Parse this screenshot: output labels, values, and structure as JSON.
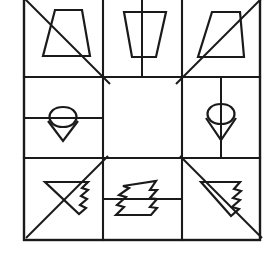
{
  "puzzle": {
    "title": "Matrix Reasoning Item",
    "type": "progressive-matrix",
    "rows": 3,
    "columns": 3,
    "stroke_color": "#1a1a1a",
    "background_color": "#ffffff",
    "grid": {
      "x_lines": [
        24,
        103,
        182,
        260
      ],
      "y_lines": [
        -2,
        77,
        158,
        240
      ],
      "border_width": 2.2,
      "inner_width": 1.9,
      "note": "top edge of grid is cropped at image top"
    },
    "cells": [
      {
        "id": "cell-r1c1",
        "row": 1,
        "column": 1,
        "shape": "trapezoid",
        "shape_label": "trapezoid-wide-bottom",
        "overlay": "diagonal-down-right",
        "overlay_label": "diagonal line top-left to bottom-right",
        "empty": false
      },
      {
        "id": "cell-r1c2",
        "row": 1,
        "column": 2,
        "shape": "trapezoid",
        "shape_label": "trapezoid-wide-top",
        "overlay": "vertical",
        "overlay_label": "vertical line through centre",
        "empty": false
      },
      {
        "id": "cell-r1c3",
        "row": 1,
        "column": 3,
        "shape": "trapezoid",
        "shape_label": "trapezoid-wide-bottom",
        "overlay": "diagonal-up-right",
        "overlay_label": "diagonal line bottom-left to top-right",
        "empty": false
      },
      {
        "id": "cell-r2c1",
        "row": 2,
        "column": 1,
        "shape": "teardrop",
        "shape_label": "teardrop point-down",
        "overlay": "horizontal",
        "overlay_label": "horizontal line through centre",
        "empty": false
      },
      {
        "id": "cell-r2c2",
        "row": 2,
        "column": 2,
        "shape": "none",
        "shape_label": "blank - missing element",
        "overlay": "none",
        "overlay_label": "none",
        "empty": true
      },
      {
        "id": "cell-r2c3",
        "row": 2,
        "column": 3,
        "shape": "teardrop",
        "shape_label": "teardrop point-down",
        "overlay": "vertical",
        "overlay_label": "vertical line through centre",
        "empty": false
      },
      {
        "id": "cell-r3c1",
        "row": 3,
        "column": 1,
        "shape": "jagged",
        "shape_label": "sawtooth wedge",
        "overlay": "diagonal-up-right",
        "overlay_label": "diagonal line bottom-left to top-right",
        "empty": false
      },
      {
        "id": "cell-r3c2",
        "row": 3,
        "column": 2,
        "shape": "jagged",
        "shape_label": "sawtooth wedge",
        "overlay": "horizontal",
        "overlay_label": "horizontal line through centre",
        "empty": false
      },
      {
        "id": "cell-r3c3",
        "row": 3,
        "column": 3,
        "shape": "jagged",
        "shape_label": "sawtooth wedge",
        "overlay": "diagonal-down-right",
        "overlay_label": "diagonal line top-left to bottom-right",
        "empty": false
      }
    ]
  }
}
